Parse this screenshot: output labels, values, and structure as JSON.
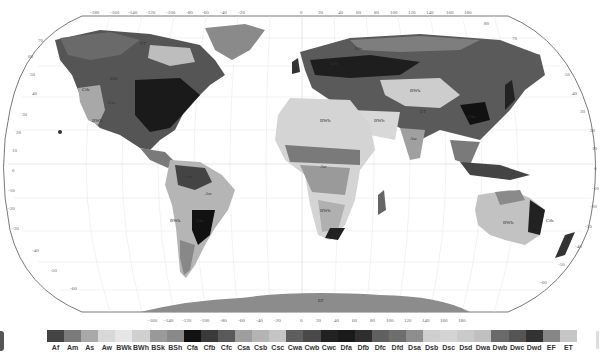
{
  "map": {
    "title": "Köppen-Geiger climate classification world map",
    "projection": "Robinson",
    "lon_ticks": [
      "-180",
      "-160",
      "-140",
      "-120",
      "-100",
      "-80",
      "-60",
      "-40",
      "-20",
      "0",
      "20",
      "40",
      "60",
      "80",
      "100",
      "120",
      "140",
      "160",
      "180"
    ],
    "lat_ticks_left": [
      "90",
      "80",
      "70",
      "60",
      "50",
      "40",
      "30",
      "20",
      "10",
      "0",
      "-10",
      "-20",
      "-30",
      "-40",
      "-50",
      "-60",
      "-70",
      "-80",
      "-90"
    ],
    "lat_ticks_right": [
      "80",
      "70",
      "60",
      "50",
      "40",
      "30",
      "20",
      "10",
      "0",
      "-10",
      "-20",
      "-30",
      "-40",
      "-50",
      "-60",
      "-70"
    ],
    "region_labels": [
      {
        "text": "Cfb",
        "x": 82,
        "y": 91
      },
      {
        "text": "BWk",
        "x": 92,
        "y": 122
      },
      {
        "text": "Cfa",
        "x": 108,
        "y": 104
      },
      {
        "text": "Dfb",
        "x": 110,
        "y": 80
      },
      {
        "text": "ET",
        "x": 140,
        "y": 45
      },
      {
        "text": "Dfc",
        "x": 285,
        "y": 55
      },
      {
        "text": "Dfb",
        "x": 330,
        "y": 65
      },
      {
        "text": "BWh",
        "x": 320,
        "y": 98
      },
      {
        "text": "BWh",
        "x": 374,
        "y": 122
      },
      {
        "text": "BWk",
        "x": 410,
        "y": 92
      },
      {
        "text": "ET",
        "x": 380,
        "y": 113
      },
      {
        "text": "Cfa",
        "x": 444,
        "y": 118
      },
      {
        "text": "Aw",
        "x": 393,
        "y": 140
      },
      {
        "text": "Aw",
        "x": 330,
        "y": 168
      },
      {
        "text": "BWh",
        "x": 350,
        "y": 220
      },
      {
        "text": "BWk",
        "x": 170,
        "y": 242
      },
      {
        "text": "Am",
        "x": 180,
        "y": 183
      },
      {
        "text": "Aw",
        "x": 185,
        "y": 200
      },
      {
        "text": "Cfa",
        "x": 198,
        "y": 222
      },
      {
        "text": "BWh",
        "x": 504,
        "y": 226
      },
      {
        "text": "Cfb",
        "x": 531,
        "y": 228
      },
      {
        "text": "EF",
        "x": 320,
        "y": 302
      }
    ]
  },
  "legend": {
    "items": [
      {
        "code": "Af",
        "color": "#444444"
      },
      {
        "code": "Am",
        "color": "#7a7a7a"
      },
      {
        "code": "As",
        "color": "#a8a8a8"
      },
      {
        "code": "Aw",
        "color": "#d8d8d8"
      },
      {
        "code": "BWk",
        "color": "#e6e6e6"
      },
      {
        "code": "BWh",
        "color": "#d0d0d0"
      },
      {
        "code": "BSk",
        "color": "#9a9a9a"
      },
      {
        "code": "BSh",
        "color": "#8a8a8a"
      },
      {
        "code": "Cfa",
        "color": "#111111"
      },
      {
        "code": "Cfb",
        "color": "#3a3a3a"
      },
      {
        "code": "Cfc",
        "color": "#5a5a5a"
      },
      {
        "code": "Csa",
        "color": "#9e9e9e"
      },
      {
        "code": "Csb",
        "color": "#b4b4b4"
      },
      {
        "code": "Csc",
        "color": "#c4c4c4"
      },
      {
        "code": "Cwa",
        "color": "#5e5e5e"
      },
      {
        "code": "Cwb",
        "color": "#4a4a4a"
      },
      {
        "code": "Cwc",
        "color": "#222222"
      },
      {
        "code": "Dfa",
        "color": "#1a1a1a"
      },
      {
        "code": "Dfb",
        "color": "#2e2e2e"
      },
      {
        "code": "Dfc",
        "color": "#606060"
      },
      {
        "code": "Dfd",
        "color": "#6e6e6e"
      },
      {
        "code": "Dsa",
        "color": "#8e8e8e"
      },
      {
        "code": "Dsb",
        "color": "#cfcfcf"
      },
      {
        "code": "Dsc",
        "color": "#d4d4d4"
      },
      {
        "code": "Dsd",
        "color": "#cacaca"
      },
      {
        "code": "Dwa",
        "color": "#c0c0c0"
      },
      {
        "code": "Dwb",
        "color": "#6a6a6a"
      },
      {
        "code": "Dwc",
        "color": "#555555"
      },
      {
        "code": "Dwd",
        "color": "#333333"
      },
      {
        "code": "EF",
        "color": "#868686"
      },
      {
        "code": "ET",
        "color": "#c6c6c6"
      }
    ]
  }
}
